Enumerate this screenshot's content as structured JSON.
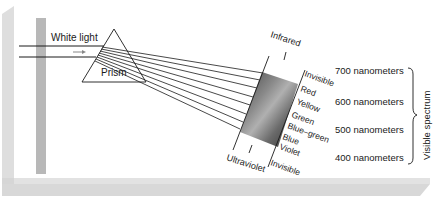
{
  "labels": {
    "white_light": "White light",
    "prism": "Prism",
    "infrared": "Infrared",
    "ultraviolet": "Ultraviolet",
    "invisible_top": "Invisible",
    "invisible_bottom": "Invisible",
    "visible_spectrum": "Visible spectrum"
  },
  "colors_list": [
    "Red",
    "Yellow",
    "Green",
    "Blue–green",
    "Blue",
    "Violet"
  ],
  "wavelengths": [
    "700 nanometers",
    "600 nanometers",
    "500 nanometers",
    "400 nanometers"
  ],
  "palette": {
    "backdrop": "#dcdcdc",
    "post": "#b8b8b8",
    "ink": "#1a1a1a",
    "screen_dark": "#3a3a3a",
    "screen_light": "#9a9a9a"
  }
}
